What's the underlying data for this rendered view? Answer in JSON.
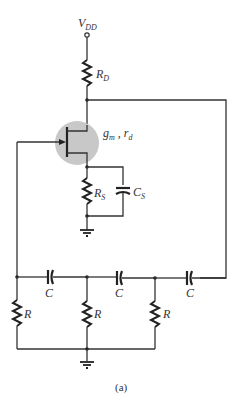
{
  "diagram": {
    "type": "circuit",
    "labels": {
      "supply": {
        "main": "V",
        "sub": "DD"
      },
      "drain_resistor": {
        "main": "R",
        "sub": "D"
      },
      "transistor_params": {
        "g": "g",
        "g_sub": "m",
        "sep": " , ",
        "r": "r",
        "r_sub": "d"
      },
      "source_resistor": {
        "main": "R",
        "sub": "S"
      },
      "source_capacitor": {
        "main": "C",
        "sub": "S"
      },
      "ladder_capacitors": [
        "C",
        "C",
        "C"
      ],
      "ladder_resistors": [
        "R",
        "R",
        "R"
      ]
    },
    "caption": "(a)",
    "colors": {
      "wire": "#333333",
      "transistor_highlight": "#c8c8c8"
    }
  }
}
